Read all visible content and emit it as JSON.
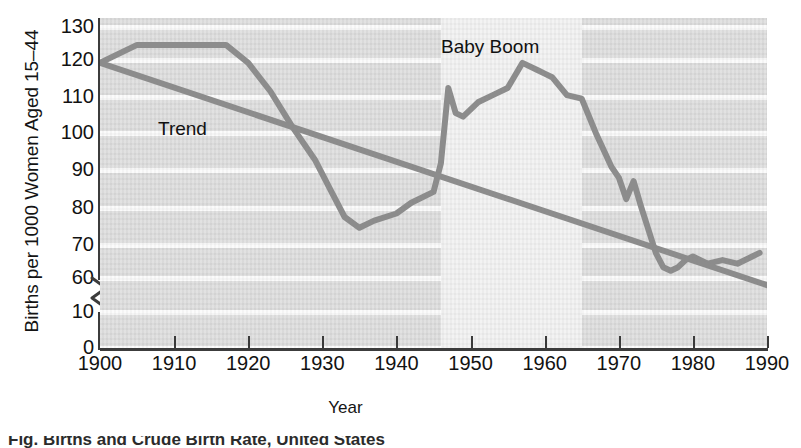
{
  "axes": {
    "ylabel": "Births per 1000 Women Aged 15–44",
    "xlabel": "Year",
    "yticks": [
      "130",
      "120",
      "110",
      "100",
      "90",
      "80",
      "70",
      "60",
      "10",
      "0"
    ],
    "xticks": [
      "1900",
      "1910",
      "1920",
      "1930",
      "1940",
      "1950",
      "1960",
      "1970",
      "1980",
      "1990"
    ]
  },
  "annotations": {
    "trend": "Trend",
    "baby_boom": "Baby Boom"
  },
  "caption": "Fig. Births and Crude Birth Rate, United States",
  "colors": {
    "line": "#8c8c8c",
    "plot_background": "#dedede",
    "gridline": "#fbfbfb",
    "band": "#f2f2f2",
    "axis": "#3c3c3c",
    "text": "#121212"
  },
  "chart_data": {
    "type": "line",
    "title": "",
    "xlabel": "Year",
    "ylabel": "Births per 1000 Women Aged 15–44",
    "xlim": [
      1900,
      1990
    ],
    "ylim": [
      0,
      130
    ],
    "y_axis_break": {
      "between": [
        10,
        60
      ],
      "note": "axis broken between 10 and 60"
    },
    "grid": true,
    "legend": false,
    "shaded_region": {
      "label": "Baby Moom placeholder",
      "name": "Baby Boom",
      "x_start": 1946,
      "x_end": 1965
    },
    "series": [
      {
        "name": "Births per 1000 Women Aged 15-44",
        "x": [
          1900,
          1905,
          1910,
          1915,
          1917,
          1920,
          1923,
          1926,
          1929,
          1931,
          1933,
          1935,
          1937,
          1940,
          1942,
          1945,
          1946,
          1947,
          1948,
          1949,
          1951,
          1953,
          1955,
          1957,
          1959,
          1960,
          1961,
          1963,
          1965,
          1967,
          1969,
          1970,
          1971,
          1972,
          1973,
          1975,
          1976,
          1977,
          1978,
          1979,
          1980,
          1982,
          1984,
          1986,
          1988,
          1989
        ],
        "y": [
          120,
          125,
          125,
          125,
          125,
          120,
          112,
          102,
          93,
          85,
          77,
          74,
          76,
          78,
          81,
          84,
          92,
          113,
          106,
          105,
          109,
          111,
          113,
          120,
          118,
          117,
          116,
          111,
          110,
          100,
          91,
          88,
          82,
          87,
          80,
          67,
          63,
          62,
          63,
          65,
          66,
          64,
          65,
          64,
          66,
          67
        ]
      },
      {
        "name": "Trend",
        "x": [
          1900,
          1990
        ],
        "y": [
          120,
          58
        ]
      }
    ]
  }
}
